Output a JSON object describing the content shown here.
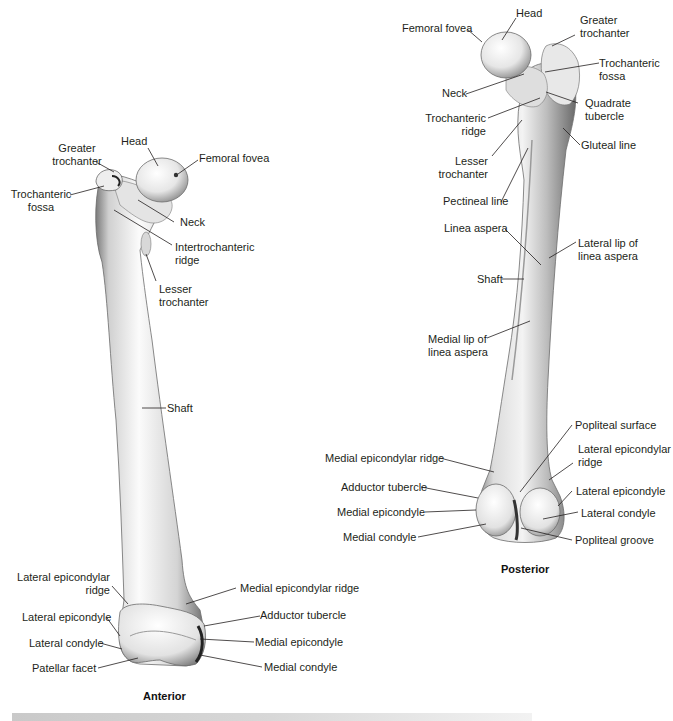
{
  "figure": {
    "anterior": {
      "caption": "Anterior",
      "labels": {
        "head": "Head",
        "greater_trochanter_1": "Greater",
        "greater_trochanter_2": "trochanter",
        "femoral_fovea": "Femoral fovea",
        "trochanteric_fossa_1": "Trochanteric",
        "trochanteric_fossa_2": "fossa",
        "neck": "Neck",
        "intertrochanteric_ridge_1": "Intertrochanteric",
        "intertrochanteric_ridge_2": "ridge",
        "lesser_trochanter_1": "Lesser",
        "lesser_trochanter_2": "trochanter",
        "shaft": "Shaft",
        "lateral_epicondylar_ridge_1": "Lateral epicondylar",
        "lateral_epicondylar_ridge_2": "ridge",
        "medial_epicondylar_ridge": "Medial epicondylar ridge",
        "lateral_epicondyle": "Lateral epicondyle",
        "adductor_tubercle": "Adductor tubercle",
        "lateral_condyle": "Lateral condyle",
        "medial_epicondyle": "Medial epicondyle",
        "patellar_facet": "Patellar facet",
        "medial_condyle": "Medial condyle"
      }
    },
    "posterior": {
      "caption": "Posterior",
      "labels": {
        "head": "Head",
        "femoral_fovea": "Femoral fovea",
        "greater_trochanter_1": "Greater",
        "greater_trochanter_2": "trochanter",
        "trochanteric_fossa_1": "Trochanteric",
        "trochanteric_fossa_2": "fossa",
        "neck": "Neck",
        "quadrate_tubercle_1": "Quadrate",
        "quadrate_tubercle_2": "tubercle",
        "trochanteric_ridge_1": "Trochanteric",
        "trochanteric_ridge_2": "ridge",
        "gluteal_line": "Gluteal line",
        "lesser_trochanter_1": "Lesser",
        "lesser_trochanter_2": "trochanter",
        "pectineal_line": "Pectineal line",
        "linea_aspera": "Linea aspera",
        "lateral_lip_1": "Lateral lip of",
        "lateral_lip_2": "linea aspera",
        "shaft": "Shaft",
        "medial_lip_1": "Medial lip of",
        "medial_lip_2": "linea aspera",
        "popliteal_surface": "Popliteal surface",
        "lateral_epicondylar_ridge_1": "Lateral epicondylar",
        "lateral_epicondylar_ridge_2": "ridge",
        "medial_epicondylar_ridge": "Medial epicondylar ridge",
        "adductor_tubercle": "Adductor tubercle",
        "lateral_epicondyle": "Lateral epicondyle",
        "medial_epicondyle": "Medial epicondyle",
        "lateral_condyle": "Lateral condyle",
        "medial_condyle": "Medial condyle",
        "popliteal_groove": "Popliteal groove"
      }
    }
  },
  "colors": {
    "bone_light": "#f7f7f7",
    "bone_mid": "#d9d9d9",
    "bone_dark": "#8a8a8a",
    "leader_line": "#231f20",
    "text": "#231f20"
  }
}
